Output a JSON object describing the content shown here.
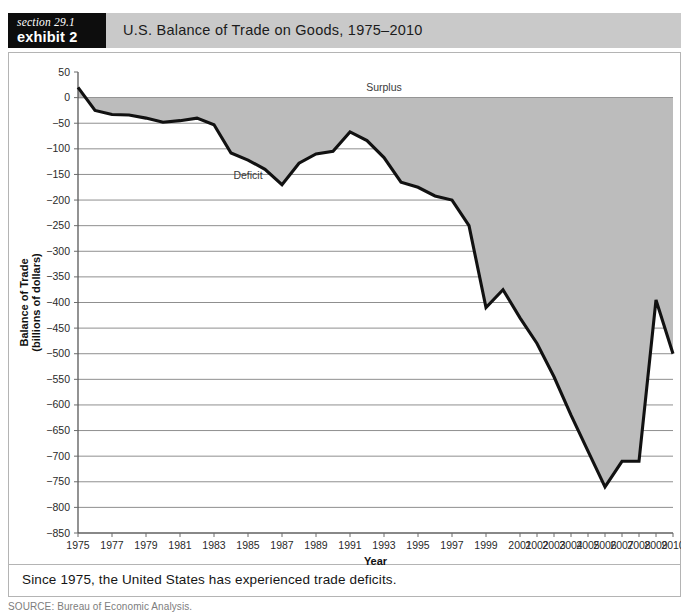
{
  "header": {
    "section_label": "section 29.1",
    "exhibit_label": "exhibit 2",
    "title": "U.S. Balance of Trade on Goods, 1975–2010"
  },
  "caption": {
    "text": "Since 1975, the United States has experienced trade deficits."
  },
  "source": {
    "text": "SOURCE: Bureau of Economic Analysis."
  },
  "colors": {
    "banner_bg": "#c9c9c9",
    "tag_bg": "#0d0d0d",
    "area_fill": "#bcbcbc",
    "line_stroke": "#111111",
    "grid": "#8f8f8f",
    "frame_border": "#b4b4b4"
  },
  "chart_data": {
    "type": "area",
    "title": "U.S. Balance of Trade on Goods, 1975–2010",
    "xlabel": "Year",
    "ylabel": "Balance of Trade\n(billions of dollars)",
    "ylabel_line1": "Balance of Trade",
    "ylabel_line2": "(billions of dollars)",
    "ylim": [
      -850,
      50
    ],
    "ytick_step": 50,
    "yticks": [
      50,
      0,
      -50,
      -100,
      -150,
      -200,
      -250,
      -300,
      -350,
      -400,
      -450,
      -500,
      -550,
      -600,
      -650,
      -700,
      -750,
      -800,
      -850
    ],
    "ytick_labels": [
      "50",
      "0",
      "−50",
      "−100",
      "−150",
      "−200",
      "−250",
      "−300",
      "−350",
      "−400",
      "−450",
      "−500",
      "−550",
      "−600",
      "−650",
      "−700",
      "−750",
      "−800",
      "−850"
    ],
    "xlim": [
      1975,
      2010
    ],
    "xtick_labels": [
      "1975",
      "1977",
      "1979",
      "1981",
      "1983",
      "1985",
      "1987",
      "1989",
      "1991",
      "1993",
      "1995",
      "1997",
      "1999",
      "2001",
      "2002",
      "2003",
      "2004",
      "2005",
      "2006",
      "2007",
      "2008",
      "2009",
      "2010"
    ],
    "xtick_values": [
      1975,
      1977,
      1979,
      1981,
      1983,
      1985,
      1987,
      1989,
      1991,
      1993,
      1995,
      1997,
      1999,
      2001,
      2002,
      2003,
      2004,
      2005,
      2006,
      2007,
      2008,
      2009,
      2010
    ],
    "grid": true,
    "legend": "none",
    "baseline": 0,
    "annotations": [
      {
        "text": "Surplus",
        "x": 1993,
        "y": 12
      },
      {
        "text": "Deficit",
        "x": 1985,
        "y": -158
      }
    ],
    "x": [
      1975,
      1976,
      1977,
      1978,
      1979,
      1980,
      1981,
      1982,
      1983,
      1984,
      1985,
      1986,
      1987,
      1988,
      1989,
      1990,
      1991,
      1992,
      1993,
      1994,
      1995,
      1996,
      1997,
      1998,
      1999,
      2000,
      2001,
      2002,
      2003,
      2004,
      2005,
      2006,
      2007,
      2008,
      2009,
      2010
    ],
    "values": [
      20,
      -25,
      -33,
      -34,
      -40,
      -48,
      -45,
      -40,
      -53,
      -108,
      -122,
      -140,
      -170,
      -128,
      -110,
      -105,
      -67,
      -84,
      -117,
      -165,
      -175,
      -192,
      -200,
      -250,
      -410,
      -375,
      -430,
      -480,
      -545,
      -620,
      -690,
      -760,
      -710,
      -710,
      -395,
      -500
    ],
    "series": [
      {
        "name": "U.S. Balance of Trade on Goods",
        "unit": "billions of dollars",
        "values": [
          20,
          -25,
          -33,
          -34,
          -40,
          -48,
          -45,
          -40,
          -53,
          -108,
          -122,
          -140,
          -170,
          -128,
          -110,
          -105,
          -67,
          -84,
          -117,
          -165,
          -175,
          -192,
          -200,
          -250,
          -410,
          -375,
          -430,
          -480,
          -545,
          -620,
          -690,
          -760,
          -710,
          -710,
          -395,
          -500
        ]
      }
    ]
  }
}
